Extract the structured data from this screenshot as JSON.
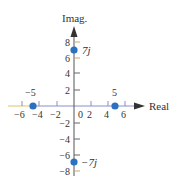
{
  "diagram": {
    "type": "complex-plane",
    "axes": {
      "x_label": "Real",
      "y_label": "Imag.",
      "x_ticks": [
        {
          "value": -6,
          "label": "−6",
          "px": 22
        },
        {
          "value": -4,
          "label": "−4",
          "px": 40
        },
        {
          "value": -2,
          "label": "−2",
          "px": 58
        },
        {
          "value": 0,
          "label": "0",
          "px": 80
        },
        {
          "value": 2,
          "label": "2",
          "px": 90
        },
        {
          "value": 4,
          "label": "4",
          "px": 106
        },
        {
          "value": 6,
          "label": "6",
          "px": 123
        }
      ],
      "y_ticks": [
        {
          "value": 8,
          "label": "8",
          "py": 42
        },
        {
          "value": 6,
          "label": "6",
          "py": 58
        },
        {
          "value": 4,
          "label": "4",
          "py": 73
        },
        {
          "value": 2,
          "label": "2",
          "py": 90
        },
        {
          "value": -2,
          "label": "−2",
          "py": 123
        },
        {
          "value": -4,
          "label": "−4",
          "py": 139
        },
        {
          "value": -6,
          "label": "−6",
          "py": 155
        },
        {
          "value": -8,
          "label": "−8",
          "py": 171
        }
      ]
    },
    "points": [
      {
        "re": 0,
        "im": 7,
        "label": "7j"
      },
      {
        "re": 0,
        "im": -7,
        "label": "−7j"
      },
      {
        "re": -5,
        "im": 0,
        "label": "−5"
      },
      {
        "re": 5,
        "im": 0,
        "label": "5"
      }
    ],
    "colors": {
      "axis": "#333333",
      "x_axis_line": "#8a8fc8",
      "x_axis_left": "#d9c66a",
      "tick_vertical": "#c8a878",
      "point": "#2a72c0",
      "text": "#333333"
    }
  }
}
